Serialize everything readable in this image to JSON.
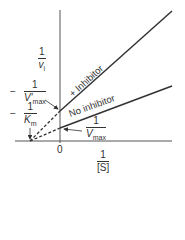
{
  "diagram": {
    "type": "lineweaver-burk-plot",
    "title": "",
    "axes": {
      "y_label": {
        "numerator": "1",
        "denominator": "v",
        "subscript": "i"
      },
      "x_label": {
        "numerator": "1",
        "denominator": "[S]"
      },
      "origin_label": "0"
    },
    "lines": [
      {
        "name": "+ Inhibitor",
        "label": "+ Inhibitor",
        "style": "solid with dashed extrapolation"
      },
      {
        "name": "No inhibitor",
        "label": "No inhibitor",
        "style": "solid with dashed extrapolation"
      }
    ],
    "intercept_labels": {
      "vmax_prime": {
        "sign": "−",
        "numerator": "1",
        "denominator": "V′",
        "subscript": "max"
      },
      "km": {
        "sign": "−",
        "numerator": "1",
        "denominator": "K",
        "subscript": "m"
      },
      "vmax": {
        "numerator": "1",
        "denominator": "V",
        "subscript": "max"
      }
    },
    "colors": {
      "ink": "#333333",
      "background": "#ffffff"
    }
  }
}
